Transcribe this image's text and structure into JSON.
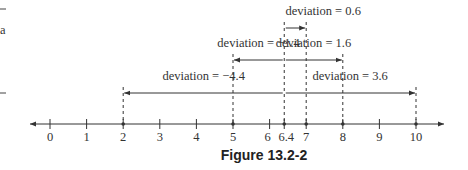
{
  "figure": {
    "caption": "Figure 13.2-2",
    "mean": 6.4,
    "mean_label": "6.4",
    "axis": {
      "min_tick": 0,
      "max_tick": 10,
      "tick_labels": [
        "0",
        "1",
        "2",
        "3",
        "4",
        "5",
        "6",
        "6.4",
        "7",
        "8",
        "9",
        "10"
      ],
      "arrows_both_ends": true
    },
    "deviations": [
      {
        "value": 0.6,
        "label": "deviation = 0.6",
        "from": 6.4,
        "to": 7,
        "row": 0
      },
      {
        "value": -1.4,
        "label": "deviation = −1.4",
        "from": 6.4,
        "to": 5,
        "row": 1
      },
      {
        "value": 1.6,
        "label": "deviation = 1.6",
        "from": 6.4,
        "to": 8,
        "row": 1
      },
      {
        "value": -4.4,
        "label": "deviation = −4.4",
        "from": 6.4,
        "to": 2,
        "row": 2
      },
      {
        "value": 3.6,
        "label": "deviation = 3.6",
        "from": 6.4,
        "to": 10,
        "row": 2
      }
    ],
    "data_points": [
      2,
      5,
      7,
      8,
      10
    ],
    "left_margin_fragment": "a"
  }
}
